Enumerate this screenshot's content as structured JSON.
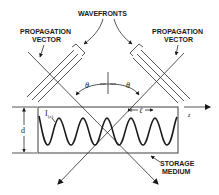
{
  "figure": {
    "labels": {
      "wavefronts": "WAVEFRONTS",
      "propagation_left_line1": "PROPAGATION",
      "propagation_left_line2": "VECTOR",
      "propagation_right_line1": "PROPAGATION",
      "propagation_right_line2": "VECTOR",
      "storage_line1": "STORAGE",
      "storage_line2": "MEDIUM",
      "theta_left": "θ",
      "theta_right": "θ",
      "thickness": "d",
      "intensity": "I",
      "intensity_arg": "(z)",
      "period": "ℓ",
      "axis": "z"
    },
    "colors": {
      "ink": "#1a1a1a",
      "background": "#ffffff"
    }
  }
}
